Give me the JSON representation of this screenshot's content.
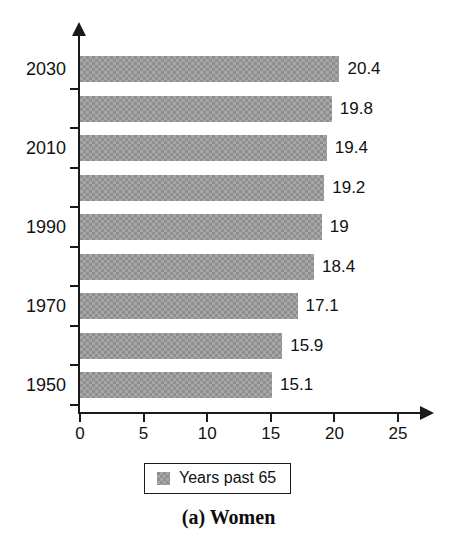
{
  "chart_data": {
    "type": "bar",
    "orientation": "horizontal",
    "title": "",
    "caption": "(a) Women",
    "categories": [
      "1950",
      "1960",
      "1970",
      "1980",
      "1990",
      "2000",
      "2010",
      "2020",
      "2030"
    ],
    "visible_category_labels": [
      "1950",
      "",
      "1970",
      "",
      "1990",
      "",
      "2010",
      "",
      "2030"
    ],
    "values": [
      15.1,
      15.9,
      17.1,
      18.4,
      19,
      19.2,
      19.4,
      19.8,
      20.4
    ],
    "value_labels": [
      "15.1",
      "15.9",
      "17.1",
      "18.4",
      "19",
      "19.2",
      "19.4",
      "19.8",
      "20.4"
    ],
    "series": [
      {
        "name": "Years past 65",
        "values": [
          15.1,
          15.9,
          17.1,
          18.4,
          19,
          19.2,
          19.4,
          19.8,
          20.4
        ]
      }
    ],
    "xlabel": "",
    "ylabel": "",
    "xlim": [
      0,
      25
    ],
    "xticks": [
      0,
      5,
      10,
      15,
      20,
      25
    ],
    "xtick_labels": [
      "0",
      "5",
      "10",
      "15",
      "20",
      "25"
    ],
    "grid": false,
    "legend": {
      "position": "bottom",
      "entries": [
        "Years past 65"
      ]
    },
    "bar_color": "#8e8e8e",
    "axis_color": "#1a1a1a"
  },
  "legend": {
    "label": "Years past 65"
  },
  "caption": {
    "text": "(a) Women"
  }
}
